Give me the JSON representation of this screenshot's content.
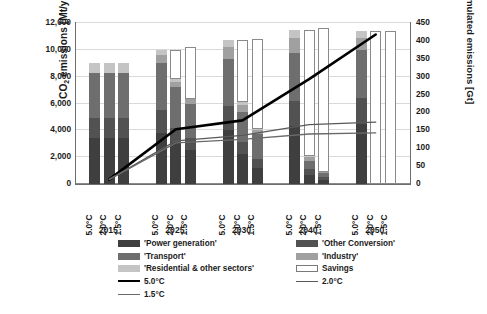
{
  "axes": {
    "left_title_main": "CO",
    "left_title_sub": "2",
    "left_title_rest": " emissions [Mt/yr]",
    "right_title": "cumulated emissions [Gt]",
    "left_ticks": [
      "12,000",
      "10,000",
      "8,000",
      "6,000",
      "4,000",
      "2,000",
      "0"
    ],
    "right_ticks": [
      "450",
      "400",
      "350",
      "300",
      "250",
      "200",
      "150",
      "100",
      "50",
      "0"
    ],
    "left_min": 0,
    "left_max": 12000,
    "left_step": 2000,
    "right_min": 0,
    "right_max": 450,
    "right_step": 50
  },
  "legend": {
    "items": [
      {
        "label": "'Power generation'",
        "type": "swatch",
        "color": "#3f3f3f"
      },
      {
        "label": "'Transport'",
        "type": "swatch",
        "color": "#6e6e6e"
      },
      {
        "label": "'Residential & other sectors'",
        "type": "swatch",
        "color": "#c4c4c4"
      },
      {
        "label": "5.0°C",
        "type": "line",
        "color": "#000000",
        "width": 2.6
      },
      {
        "label": "1.5°C",
        "type": "line",
        "color": "#6a6a6a",
        "width": 1.3
      },
      {
        "label": "'Other Conversion'",
        "type": "swatch",
        "color": "#525252"
      },
      {
        "label": "'Industry'",
        "type": "swatch",
        "color": "#a0a0a0"
      },
      {
        "label": "Savings",
        "type": "swatch",
        "color": "#ffffff"
      },
      {
        "label": "2.0°C",
        "type": "line",
        "color": "#585858",
        "width": 1.3
      }
    ]
  },
  "chart_data": {
    "type": "bar",
    "title": "",
    "xlabel": "",
    "ylabel": "CO2 emissions [Mt/yr]",
    "y2label": "cumulated emissions [Gt]",
    "ylim": [
      0,
      12000
    ],
    "y2lim": [
      0,
      450
    ],
    "grid": true,
    "legend_position": "bottom",
    "groups": [
      "2015",
      "2025",
      "2030",
      "2040",
      "2050"
    ],
    "scenarios": [
      "5.0°C",
      "2.0°C",
      "1.5°C"
    ],
    "stack_order": [
      "Power generation",
      "Other Conversion",
      "Transport",
      "Industry",
      "Residential & other sectors",
      "Savings"
    ],
    "stack_colors": {
      "Power generation": "#3f3f3f",
      "Other Conversion": "#525252",
      "Transport": "#6e6e6e",
      "Industry": "#a0a0a0",
      "Residential & other sectors": "#c4c4c4",
      "Savings": "#ffffff"
    },
    "bars": [
      {
        "group": "2015",
        "scenario": "5.0°C",
        "segments": {
          "Power generation": 3400,
          "Other Conversion": 1500,
          "Transport": 3400,
          "Industry": 0,
          "Residential & other sectors": 700,
          "Savings": 0
        },
        "total": 9000
      },
      {
        "group": "2015",
        "scenario": "2.0°C",
        "segments": {
          "Power generation": 3400,
          "Other Conversion": 1500,
          "Transport": 3400,
          "Industry": 0,
          "Residential & other sectors": 700,
          "Savings": 0
        },
        "total": 9000
      },
      {
        "group": "2015",
        "scenario": "1.5°C",
        "segments": {
          "Power generation": 3400,
          "Other Conversion": 1500,
          "Transport": 3400,
          "Industry": 0,
          "Residential & other sectors": 700,
          "Savings": 0
        },
        "total": 9100
      },
      {
        "group": "2025",
        "scenario": "5.0°C",
        "segments": {
          "Power generation": 3800,
          "Other Conversion": 1700,
          "Transport": 3500,
          "Industry": 600,
          "Residential & other sectors": 400,
          "Savings": 0
        },
        "total": 10000
      },
      {
        "group": "2025",
        "scenario": "2.0°C",
        "segments": {
          "Power generation": 3100,
          "Other Conversion": 1100,
          "Transport": 3000,
          "Industry": 400,
          "Residential & other sectors": 200,
          "Savings": 2200
        },
        "total": 10000
      },
      {
        "group": "2025",
        "scenario": "1.5°C",
        "segments": {
          "Power generation": 2500,
          "Other Conversion": 900,
          "Transport": 2600,
          "Industry": 300,
          "Residential & other sectors": 0,
          "Savings": 3900
        },
        "total": 10200
      },
      {
        "group": "2030",
        "scenario": "5.0°C",
        "segments": {
          "Power generation": 4000,
          "Other Conversion": 1800,
          "Transport": 3500,
          "Industry": 900,
          "Residential & other sectors": 500,
          "Savings": 0
        },
        "total": 10700
      },
      {
        "group": "2030",
        "scenario": "2.0°C",
        "segments": {
          "Power generation": 2200,
          "Other Conversion": 900,
          "Transport": 2300,
          "Industry": 500,
          "Residential & other sectors": 200,
          "Savings": 4600
        },
        "total": 10700
      },
      {
        "group": "2030",
        "scenario": "1.5°C",
        "segments": {
          "Power generation": 1200,
          "Other Conversion": 700,
          "Transport": 1800,
          "Industry": 300,
          "Residential & other sectors": 100,
          "Savings": 6700
        },
        "total": 10800
      },
      {
        "group": "2040",
        "scenario": "5.0°C",
        "segments": {
          "Power generation": 4300,
          "Other Conversion": 1900,
          "Transport": 3600,
          "Industry": 1100,
          "Residential & other sectors": 600,
          "Savings": 0
        },
        "total": 11500
      },
      {
        "group": "2040",
        "scenario": "2.0°C",
        "segments": {
          "Power generation": 700,
          "Other Conversion": 400,
          "Transport": 600,
          "Industry": 300,
          "Residential & other sectors": 100,
          "Savings": 9400
        },
        "total": 11500
      },
      {
        "group": "2040",
        "scenario": "1.5°C",
        "segments": {
          "Power generation": 300,
          "Other Conversion": 200,
          "Transport": 300,
          "Industry": 100,
          "Residential & other sectors": 0,
          "Savings": 10700
        },
        "total": 11600
      },
      {
        "group": "2050",
        "scenario": "5.0°C",
        "segments": {
          "Power generation": 4500,
          "Other Conversion": 1900,
          "Transport": 3600,
          "Industry": 900,
          "Residential & other sectors": 500,
          "Savings": 0
        },
        "total": 11400
      },
      {
        "group": "2050",
        "scenario": "2.0°C",
        "segments": {
          "Power generation": 0,
          "Other Conversion": 0,
          "Transport": 0,
          "Industry": 0,
          "Residential & other sectors": 0,
          "Savings": 11400
        },
        "total": 11400
      },
      {
        "group": "2050",
        "scenario": "1.5°C",
        "segments": {
          "Power generation": 0,
          "Other Conversion": 0,
          "Transport": 0,
          "Industry": 0,
          "Residential & other sectors": 0,
          "Savings": 11400
        },
        "total": 11400
      }
    ],
    "lines": [
      {
        "name": "5.0°C",
        "color": "#000000",
        "width": 2.6,
        "axis": "right",
        "x": [
          "2015",
          "2025",
          "2030",
          "2040",
          "2050"
        ],
        "values": [
          10,
          150,
          175,
          290,
          415
        ]
      },
      {
        "name": "2.0°C",
        "color": "#585858",
        "width": 1.3,
        "axis": "right",
        "x": [
          "2015",
          "2025",
          "2030",
          "2040",
          "2050"
        ],
        "values": [
          10,
          118,
          133,
          163,
          170
        ]
      },
      {
        "name": "1.5°C",
        "color": "#6a6a6a",
        "width": 1.3,
        "axis": "right",
        "x": [
          "2015",
          "2025",
          "2030",
          "2040",
          "2050"
        ],
        "values": [
          10,
          112,
          122,
          137,
          140
        ]
      }
    ]
  }
}
